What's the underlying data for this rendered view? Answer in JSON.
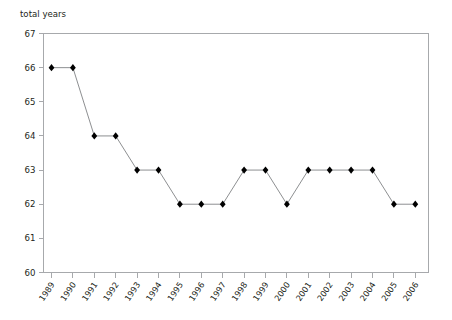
{
  "chart_data": {
    "type": "line",
    "title": "",
    "ylabel": "total years",
    "xlabel": "",
    "ylim": [
      60,
      67
    ],
    "yticks": [
      60,
      61,
      62,
      63,
      64,
      65,
      66,
      67
    ],
    "grid": false,
    "legend": "none",
    "marker": "diamond",
    "line_color": "#808285",
    "marker_color": "#000000",
    "axis_color": "#a7a9ac",
    "categories": [
      "1989",
      "1990",
      "1991",
      "1992",
      "1993",
      "1994",
      "1995",
      "1996",
      "1997",
      "1998",
      "1999",
      "2000",
      "2001",
      "2002",
      "2003",
      "2004",
      "2005",
      "2006"
    ],
    "values": [
      66,
      66,
      64,
      64,
      63,
      63,
      62,
      62,
      62,
      63,
      63,
      62,
      63,
      63,
      63,
      63,
      62,
      62
    ],
    "series": [
      {
        "name": "total years",
        "values": [
          66,
          66,
          64,
          64,
          63,
          63,
          62,
          62,
          62,
          63,
          63,
          62,
          63,
          63,
          63,
          63,
          62,
          62
        ]
      }
    ]
  }
}
